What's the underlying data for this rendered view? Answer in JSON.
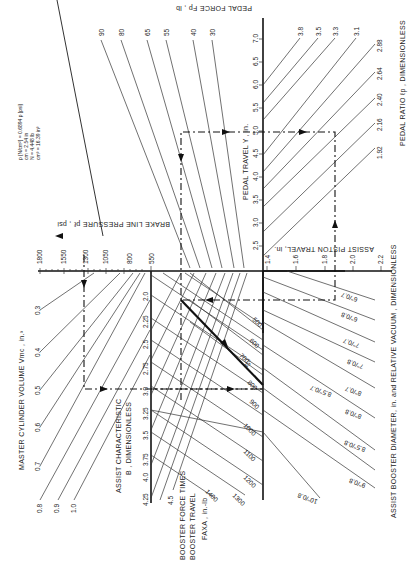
{
  "figure": {
    "units_note": {
      "lines": [
        "p [N/cm²] = 0.6894 p [psi]",
        "cm = 2.54 in",
        "N = 4.448 lb",
        "cm³ = 16.39 in³"
      ]
    },
    "axes": {
      "pedal_force": {
        "title": "PEDAL FORCE Fp , lb",
        "values": [
          "90",
          "80",
          "65",
          "55",
          "40",
          "30"
        ]
      },
      "pedal_travel": {
        "title": "PEDAL TRAVEL Y , in.",
        "ticks": [
          "2.5",
          "3.0",
          "3.5",
          "4.0",
          "4.5",
          "5.0",
          "5.5",
          "6.0",
          "6.5",
          "7.0"
        ]
      },
      "pedal_ratio": {
        "title": "PEDAL RATIO ℓp , DIMENSIONLESS",
        "values": [
          "3.8",
          "3.5",
          "3.3",
          "3.1",
          "2.88",
          "2.64",
          "2.40",
          "2.16",
          "1.92"
        ]
      },
      "brake_line_pressure": {
        "title": "BRAKE LINE PRESSURE pℓ , psi",
        "ticks": [
          "1800",
          "1550",
          "1300",
          "1050",
          "800",
          "550"
        ]
      },
      "assist_piston_travel": {
        "title": "ASSIST PISTON TRAVEL, in.",
        "ticks": [
          "1.4",
          "1.6",
          "1.8",
          "2.0",
          "2.2"
        ]
      },
      "master_cylinder_volume": {
        "title": "MASTER CYLINDER VOLUME Vmc , in.³",
        "values": [
          "0.3",
          "0.4",
          "0.5",
          "0.6",
          "0.7",
          "0.8",
          "0.9",
          "1.0"
        ]
      },
      "assist_characteristic": {
        "title_line1": "ASSIST CHARACTERISTIC",
        "title_line2": "B , DIMENSIONLESS",
        "ticks": [
          "2.0",
          "2.25",
          "2.5",
          "2.75",
          "3.0",
          "3.25",
          "3.5",
          "3.75",
          "4.0",
          "4.25",
          "4.5"
        ]
      },
      "booster_force_travel": {
        "title_line1": "BOOSTER FORCE TIMES",
        "title_line2": "BOOSTER TRAVEL",
        "title_line3": "FAXA , in.-lb",
        "values": [
          "500",
          "600",
          "700",
          "800",
          "900",
          "1000",
          "1100",
          "1200",
          "1300",
          "1400"
        ]
      },
      "assist_booster_diameter": {
        "title": "ASSIST BOOSTER DIAMETER, in. and RELATIVE VACUUM , DIMENSIONLESS",
        "values": [
          "6''/0.7",
          "6''/0.8",
          "7''/0.7",
          "7''/0.8",
          "8''/0.7",
          "8''/0.8",
          "8.5''/0.7",
          "8.5''/0.8",
          "9''/0.8",
          "10''/0.8"
        ]
      }
    },
    "annotation": {
      "angle": "45°"
    },
    "colors": {
      "ink": "#111111",
      "paper": "#ffffff"
    }
  }
}
